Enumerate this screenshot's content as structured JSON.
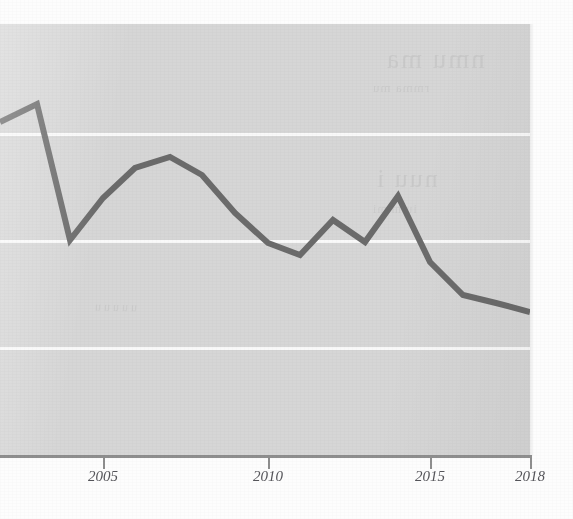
{
  "figure": {
    "kind": "scanned-book-line-chart",
    "plot_background_color": "#d6d6d6",
    "gridline_color": "#fbfbfb",
    "line_color": "#6b6b6b",
    "axis_color": "#8e8e8e",
    "tick_label_color": "#55555a"
  },
  "axis": {
    "ticks": [
      {
        "label": "2005",
        "x": 103
      },
      {
        "label": "2010",
        "x": 268
      },
      {
        "label": "2015",
        "x": 430
      },
      {
        "label": "2018",
        "x": 530
      }
    ]
  },
  "gridlines": {
    "y_positions": [
      109,
      216,
      323
    ]
  },
  "bleed_through": {
    "note": "faint illegible show-through text from the reverse side of the scanned page",
    "fragments": [
      "nmu ma",
      "rmma  mu",
      "nuu i",
      "iuim mi",
      "uuuuu"
    ]
  },
  "chart_data": {
    "type": "line",
    "title": "",
    "xlabel": "",
    "ylabel": "",
    "grid": true,
    "legend": null,
    "xlim": [
      2002,
      2018
    ],
    "ylim": [
      0,
      4
    ],
    "note": "Series is cropped at the left edge of the image; values are read off the three unlabeled horizontal gridlines (unlabeled y-axis). Units unknown.",
    "x": [
      2002,
      2003,
      2004,
      2005,
      2006,
      2007,
      2008,
      2009,
      2010,
      2011,
      2012,
      2013,
      2014,
      2015,
      2016,
      2017,
      2018
    ],
    "values": [
      3.22,
      3.39,
      2.0,
      2.39,
      2.67,
      2.78,
      2.61,
      2.26,
      1.97,
      1.86,
      2.19,
      1.98,
      2.41,
      1.79,
      1.48,
      1.41,
      1.32
    ],
    "pixel_points": [
      {
        "x": 0,
        "y": 122
      },
      {
        "x": 37,
        "y": 104
      },
      {
        "x": 70,
        "y": 240
      },
      {
        "x": 103,
        "y": 198
      },
      {
        "x": 135,
        "y": 168
      },
      {
        "x": 170,
        "y": 157
      },
      {
        "x": 202,
        "y": 175
      },
      {
        "x": 235,
        "y": 213
      },
      {
        "x": 268,
        "y": 243
      },
      {
        "x": 300,
        "y": 255
      },
      {
        "x": 333,
        "y": 220
      },
      {
        "x": 365,
        "y": 242
      },
      {
        "x": 398,
        "y": 196
      },
      {
        "x": 430,
        "y": 262
      },
      {
        "x": 463,
        "y": 295
      },
      {
        "x": 496,
        "y": 303
      },
      {
        "x": 530,
        "y": 312
      }
    ]
  }
}
